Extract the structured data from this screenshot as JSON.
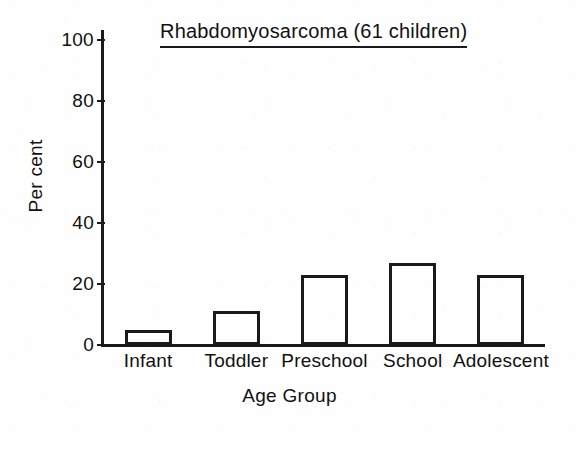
{
  "chart_data": {
    "type": "bar",
    "title": "Rhabdomyosarcoma (61 children)",
    "xlabel": "Age Group",
    "ylabel": "Per cent",
    "categories": [
      "Infant",
      "Toddler",
      "Preschool",
      "School",
      "Adolescent"
    ],
    "values": [
      5,
      11,
      23,
      27,
      23
    ],
    "ylim": [
      0,
      100
    ],
    "ytick_labels": [
      "0",
      "20",
      "40",
      "60",
      "80",
      "100"
    ],
    "ytick_values": [
      0,
      20,
      40,
      60,
      80,
      100
    ],
    "grid": false,
    "legend": "none",
    "bar_fill": "#ffffff",
    "bar_outline": "#1a1a1a",
    "axis_color": "#1a1a1a",
    "background": "#fefefe",
    "title_underlined": true,
    "n_subjects": 61
  }
}
